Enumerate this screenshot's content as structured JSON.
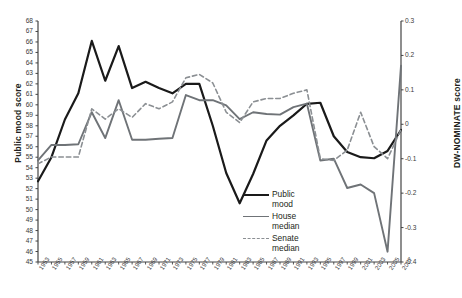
{
  "chart_data": {
    "type": "line",
    "title": "",
    "xlabel": "",
    "ylabel": "Public mood score",
    "y2label": "DW-NOMINATE score",
    "ylim": [
      45,
      68
    ],
    "y2lim": [
      -0.4,
      0.3
    ],
    "grid": false,
    "legend_position": "inside-center-bottom",
    "x": [
      1953,
      1955,
      1957,
      1959,
      1961,
      1963,
      1965,
      1967,
      1969,
      1971,
      1973,
      1975,
      1977,
      1979,
      1981,
      1983,
      1985,
      1987,
      1989,
      1991,
      1993,
      1995,
      1997,
      1999,
      2001,
      2003,
      2005,
      2007
    ],
    "xticklabels": [
      "1953",
      "1955",
      "1957",
      "1959",
      "1961",
      "1963",
      "1965",
      "1967",
      "1969",
      "1971",
      "1973",
      "1975",
      "1977",
      "1979",
      "1981",
      "1983",
      "1985",
      "1987",
      "1989",
      "1991",
      "1993",
      "1995",
      "1997",
      "1999",
      "2001",
      "2003",
      "2005",
      "2007"
    ],
    "yticklabels": [
      "68",
      "67",
      "66",
      "65",
      "64",
      "63",
      "62",
      "61",
      "60",
      "59",
      "58",
      "57",
      "56",
      "55",
      "54",
      "53",
      "52",
      "51",
      "50",
      "49",
      "48",
      "47",
      "46",
      "45"
    ],
    "y2ticklabels": [
      "0.3",
      "0.2",
      "0.1",
      "0",
      "-0.1",
      "-0.2",
      "-0.3",
      "-0.4"
    ],
    "series": [
      {
        "name": "Public mood",
        "axis": "left",
        "style": "solid",
        "color": "#1a1a1a",
        "width": 2.2,
        "values": [
          52.7,
          55.0,
          58.6,
          61.1,
          66.1,
          62.3,
          65.6,
          61.6,
          62.2,
          61.6,
          61.1,
          62.0,
          62.0,
          58.0,
          53.5,
          50.6,
          53.4,
          56.6,
          58.0,
          59.0,
          60.1,
          60.2,
          57.0,
          55.5,
          55.0,
          54.9,
          55.6,
          57.6
        ]
      },
      {
        "name": "House median",
        "axis": "right",
        "style": "solid",
        "color": "#6f7377",
        "width": 1.9,
        "values": [
          -0.105,
          -0.06,
          -0.06,
          -0.058,
          0.035,
          -0.04,
          0.07,
          -0.045,
          -0.045,
          -0.042,
          -0.04,
          0.085,
          0.07,
          0.07,
          0.055,
          0.015,
          0.035,
          0.03,
          0.028,
          0.05,
          0.06,
          -0.105,
          -0.1,
          -0.185,
          -0.175,
          -0.2,
          -0.37,
          0.17
        ]
      },
      {
        "name": "Senate median",
        "axis": "right",
        "style": "dashed",
        "color": "#8b8f93",
        "width": 1.6,
        "values": [
          -0.115,
          -0.095,
          -0.095,
          -0.095,
          0.045,
          0.015,
          0.045,
          0.02,
          0.06,
          0.045,
          0.065,
          0.135,
          0.145,
          0.12,
          0.035,
          0.005,
          0.065,
          0.075,
          0.075,
          0.09,
          0.1,
          -0.1,
          -0.105,
          -0.075,
          0.035,
          -0.065,
          -0.1,
          -0.015
        ]
      }
    ]
  },
  "legend": {
    "items": [
      {
        "label_line1": "Public",
        "label_line2": "mood",
        "key": "k-mood"
      },
      {
        "label_line1": "House",
        "label_line2": "median",
        "key": "k-house"
      },
      {
        "label_line1": "Senate",
        "label_line2": "median",
        "key": "k-senate"
      }
    ]
  }
}
